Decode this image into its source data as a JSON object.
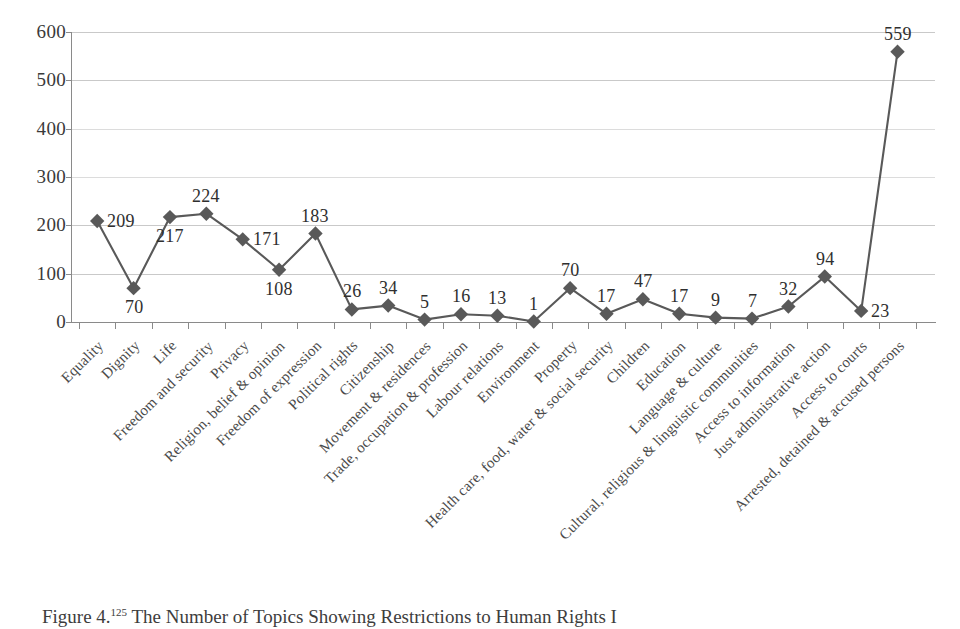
{
  "figure": {
    "caption_prefix": "Figure 4.",
    "caption_footnote": "125",
    "caption_text": " The Number of Topics Showing Restrictions to Human Rights I"
  },
  "chart_data": {
    "type": "line",
    "title": "",
    "subtitle": "",
    "xlabel": "",
    "ylabel": "",
    "ylim": [
      0,
      600
    ],
    "ytick_step": 100,
    "yticks": [
      "0",
      "100",
      "200",
      "300",
      "400",
      "500",
      "600"
    ],
    "grid": true,
    "legend": "none",
    "marker": "diamond",
    "marker_color": "#595959",
    "line_color": "#595959",
    "data_labels": true,
    "categories": [
      "Equality",
      "Dignity",
      "Life",
      "Freedom and security",
      "Privacy",
      "Religion, belief & opinion",
      "Freedom of expression",
      "Political rights",
      "Citizenship",
      "Movement & residences",
      "Trade, occupation & profession",
      "Labour relations",
      "Environment",
      "Property",
      "Health care, food, water & social security",
      "Children",
      "Education",
      "Language & culture",
      "Cultural, religious & linguistic communities",
      "Access to information",
      "Just administrative action",
      "Access to courts",
      "Arrested, detained & accused persons"
    ],
    "values": [
      209,
      70,
      217,
      224,
      171,
      108,
      183,
      26,
      34,
      5,
      16,
      13,
      1,
      70,
      17,
      47,
      17,
      9,
      7,
      32,
      94,
      23,
      559
    ],
    "series": [
      {
        "name": "Number of topics",
        "values": [
          209,
          70,
          217,
          224,
          171,
          108,
          183,
          26,
          34,
          5,
          16,
          13,
          1,
          70,
          17,
          47,
          17,
          9,
          7,
          32,
          94,
          23,
          559
        ]
      }
    ],
    "label_positions": [
      "right",
      "below",
      "below",
      "above",
      "right",
      "below",
      "above",
      "above",
      "above",
      "above",
      "above",
      "above",
      "above",
      "above",
      "above",
      "above",
      "above",
      "above",
      "above",
      "above",
      "above",
      "right",
      "above"
    ]
  }
}
